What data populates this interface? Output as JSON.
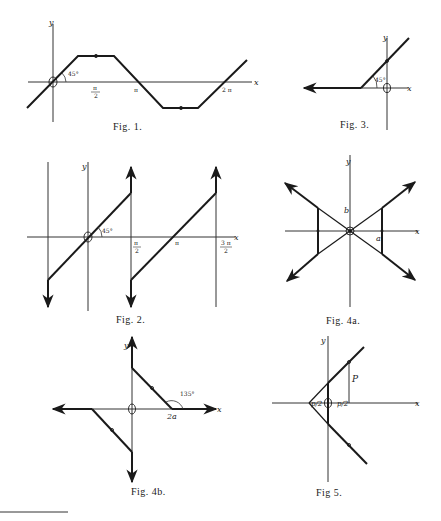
{
  "figures": {
    "fig1": {
      "caption": "Fig. 1.",
      "x_label": "x",
      "y_label": "y",
      "angle_label": "45°",
      "tick_pi_over_2_num": "π",
      "tick_pi_over_2_den": "2",
      "tick_pi": "π",
      "tick_2pi": "2 π"
    },
    "fig2": {
      "caption": "Fig. 2.",
      "x_label": "x",
      "y_label": "y",
      "angle_label": "45°",
      "tick_pi_over_2_num": "π",
      "tick_pi_over_2_den": "2",
      "tick_pi": "π",
      "tick_3pi_over_2_num": "3 π",
      "tick_3pi_over_2_den": "2"
    },
    "fig3": {
      "caption": "Fig. 3.",
      "x_label": "x",
      "y_label": "y",
      "angle_label": "45°"
    },
    "fig4a": {
      "caption": "Fig. 4a.",
      "x_label": "x",
      "y_label": "y",
      "a_label": "a",
      "b_label": "b"
    },
    "fig4b": {
      "caption": "Fig. 4b.",
      "x_label": "x",
      "y_label": "y",
      "angle_label": "135°",
      "tick_2a": "2a"
    },
    "fig5": {
      "caption": "Fig 5.",
      "x_label": "x",
      "y_label": "y",
      "p_label": "P",
      "left_frac": "p/2",
      "right_frac": "p/2"
    }
  },
  "colors": {
    "ink": "#1a1a1a",
    "paper": "#ffffff"
  }
}
